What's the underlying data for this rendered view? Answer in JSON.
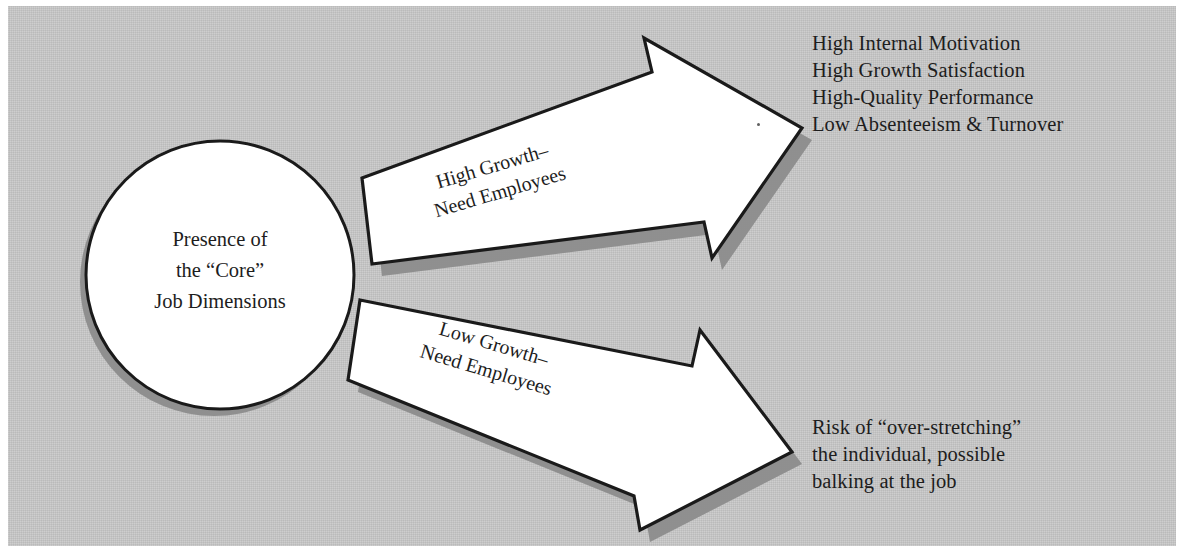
{
  "figure": {
    "panel_color": "#c8c8c8",
    "shape_fill": "#ffffff",
    "shape_stroke": "#1a1a1a",
    "shadow_color": "#8c8c8c",
    "text_color": "#1d1d1d"
  },
  "core": {
    "line1": "Presence of",
    "line2": "the “Core”",
    "line3": "Job Dimensions"
  },
  "arrows": {
    "upper": {
      "label_line1": "High Growth–",
      "label_line2": "Need Employees",
      "rotation_deg": -16.5
    },
    "lower": {
      "label_line1": "Low Growth–",
      "label_line2": "Need Employees",
      "rotation_deg": 16.5
    }
  },
  "outcomes": {
    "positive": [
      "High Internal Motivation",
      "High Growth Satisfaction",
      "High-Quality Performance",
      "Low Absenteeism & Turnover"
    ],
    "negative": [
      "Risk of “over-stretching”",
      "the individual, possible",
      "balking at the job"
    ]
  }
}
